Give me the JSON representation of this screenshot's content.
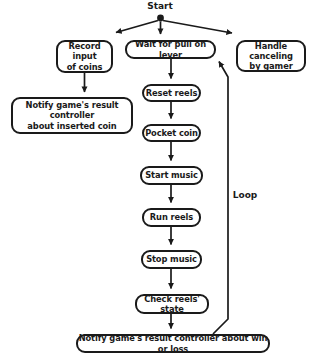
{
  "diagram": {
    "colors": {
      "stroke": "#1a1a1a",
      "fill": "#ffffff",
      "text": "#1a1a1a"
    },
    "start": {
      "label": "Start"
    },
    "loop": {
      "label": "Loop"
    },
    "nodes": [
      {
        "id": "record-input",
        "label": "Record input\nof coins"
      },
      {
        "id": "wait-lever",
        "label": "Wait for pull on lever"
      },
      {
        "id": "handle-cancel",
        "label": "Handle canceling\nby gamer"
      },
      {
        "id": "notify-inserted",
        "label": "Notify game's result controller\nabout inserted coin"
      },
      {
        "id": "reset-reels",
        "label": "Reset reels"
      },
      {
        "id": "pocket-coin",
        "label": "Pocket coin"
      },
      {
        "id": "start-music",
        "label": "Start music"
      },
      {
        "id": "run-reels",
        "label": "Run reels"
      },
      {
        "id": "stop-music",
        "label": "Stop music"
      },
      {
        "id": "check-reels",
        "label": "Check reels' state"
      },
      {
        "id": "notify-winloss",
        "label": "Notify game's result controller about win or loss"
      }
    ],
    "edges": [
      {
        "from": "start",
        "to": "record-input",
        "kind": "branch"
      },
      {
        "from": "start",
        "to": "wait-lever",
        "kind": "branch"
      },
      {
        "from": "start",
        "to": "handle-cancel",
        "kind": "branch"
      },
      {
        "from": "record-input",
        "to": "notify-inserted",
        "kind": "sequence"
      },
      {
        "from": "wait-lever",
        "to": "reset-reels",
        "kind": "sequence"
      },
      {
        "from": "reset-reels",
        "to": "pocket-coin",
        "kind": "sequence"
      },
      {
        "from": "pocket-coin",
        "to": "start-music",
        "kind": "sequence"
      },
      {
        "from": "start-music",
        "to": "run-reels",
        "kind": "sequence"
      },
      {
        "from": "run-reels",
        "to": "stop-music",
        "kind": "sequence"
      },
      {
        "from": "stop-music",
        "to": "check-reels",
        "kind": "sequence"
      },
      {
        "from": "check-reels",
        "to": "notify-winloss",
        "kind": "sequence"
      },
      {
        "from": "notify-winloss",
        "to": "wait-lever",
        "kind": "loop",
        "label": "Loop"
      }
    ]
  }
}
